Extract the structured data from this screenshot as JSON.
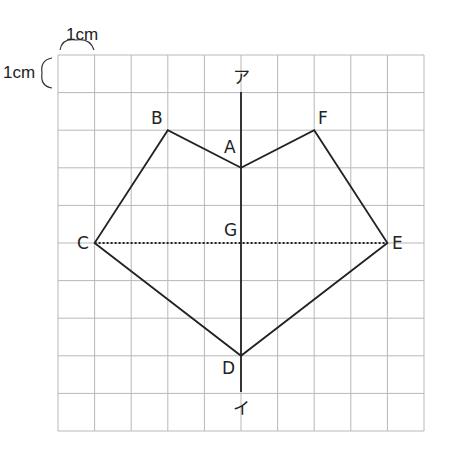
{
  "figure": {
    "type": "pentagon-like hexagon on 1cm grid with symmetry axis",
    "grid": {
      "cols": 10,
      "rows": 10,
      "cell_unit": "1cm"
    },
    "scale_labels": {
      "horizontal": "1cm",
      "vertical": "1cm"
    },
    "axis_labels": {
      "top": "ア",
      "bottom": "イ"
    },
    "points": {
      "A": {
        "label": "A",
        "grid": [
          5,
          3
        ]
      },
      "B": {
        "label": "B",
        "grid": [
          3,
          2
        ]
      },
      "C": {
        "label": "C",
        "grid": [
          1,
          5
        ]
      },
      "D": {
        "label": "D",
        "grid": [
          5,
          8
        ]
      },
      "E": {
        "label": "E",
        "grid": [
          9,
          5
        ]
      },
      "F": {
        "label": "F",
        "grid": [
          7,
          2
        ]
      },
      "G": {
        "label": "G",
        "grid": [
          5,
          5
        ]
      }
    },
    "polygon_order": [
      "A",
      "B",
      "C",
      "D",
      "E",
      "F"
    ],
    "dotted_segment": [
      "C",
      "E"
    ],
    "colors": {
      "grid": "#b8b8b8",
      "line": "#222222"
    }
  }
}
